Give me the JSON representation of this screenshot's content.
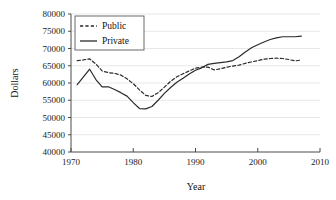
{
  "chart_data": {
    "type": "line",
    "title": "",
    "xlabel": "Year",
    "ylabel": "Dollars",
    "xlim": [
      1970,
      2010
    ],
    "ylim": [
      40000,
      80000
    ],
    "xticks": [
      1970,
      1980,
      1990,
      2000,
      2010
    ],
    "yticks": [
      40000,
      45000,
      50000,
      55000,
      60000,
      65000,
      70000,
      75000,
      80000
    ],
    "xtick_labels": [
      "1970",
      "1980",
      "1990",
      "2000",
      "2010"
    ],
    "ytick_labels": [
      "40000",
      "45000",
      "50000",
      "55000",
      "60000",
      "65000",
      "70000",
      "75000",
      "80000"
    ],
    "grid": true,
    "grid_axis": "y",
    "legend_position": "upper-left",
    "series": [
      {
        "name": "Public",
        "style": "dashed",
        "color": "#2b2b2b",
        "x": [
          1971,
          1972,
          1973,
          1974,
          1975,
          1976,
          1977,
          1978,
          1979,
          1980,
          1981,
          1982,
          1983,
          1984,
          1985,
          1986,
          1987,
          1988,
          1989,
          1990,
          1991,
          1992,
          1993,
          1994,
          1995,
          1996,
          1997,
          1998,
          1999,
          2000,
          2001,
          2002,
          2003,
          2004,
          2005,
          2006,
          2007
        ],
        "values": [
          66500,
          66700,
          67000,
          65500,
          63500,
          63000,
          62800,
          62300,
          61200,
          59800,
          58000,
          56400,
          56100,
          57200,
          58800,
          60500,
          61800,
          62700,
          63500,
          64300,
          64600,
          64600,
          63800,
          64100,
          64600,
          64900,
          65200,
          65700,
          66100,
          66500,
          66900,
          67100,
          67200,
          67100,
          66800,
          66400,
          66700
        ]
      },
      {
        "name": "Private",
        "style": "solid",
        "color": "#2b2b2b",
        "x": [
          1971,
          1972,
          1973,
          1974,
          1975,
          1976,
          1977,
          1978,
          1979,
          1980,
          1981,
          1982,
          1983,
          1984,
          1985,
          1986,
          1987,
          1988,
          1989,
          1990,
          1991,
          1992,
          1993,
          1994,
          1995,
          1996,
          1997,
          1998,
          1999,
          2000,
          2001,
          2002,
          2003,
          2004,
          2005,
          2006,
          2007
        ],
        "values": [
          59500,
          61800,
          64000,
          61000,
          58900,
          58900,
          58100,
          57200,
          56200,
          54300,
          52600,
          52500,
          53200,
          55000,
          57000,
          58700,
          60200,
          61400,
          62600,
          63700,
          64400,
          65400,
          65700,
          65900,
          66100,
          66500,
          67600,
          69000,
          70200,
          71100,
          71900,
          72600,
          73100,
          73400,
          73400,
          73400,
          73600
        ]
      }
    ]
  }
}
